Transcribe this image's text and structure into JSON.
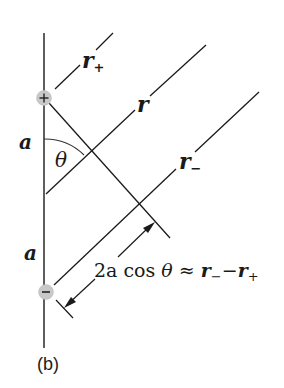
{
  "diagram": {
    "caption": "(b)",
    "labels": {
      "r_plus": "r",
      "r_plus_sub": "+",
      "r": "r",
      "r_minus": "r",
      "r_minus_sub": "−",
      "a_top": "a",
      "a_bottom": "a",
      "theta": "θ",
      "formula_prefix": "2a cos ",
      "formula_theta": "θ",
      "formula_approx": " ≈ ",
      "formula_r1": "r",
      "formula_r1_sub": "−",
      "formula_minus": "−",
      "formula_r2": "r",
      "formula_r2_sub": "+"
    },
    "charges": [
      {
        "sign": "+",
        "label": "positive-charge"
      },
      {
        "sign": "−",
        "label": "negative-charge"
      }
    ],
    "colors": {
      "line": "#1a1a1a",
      "charge_fill": "#c8c8c8",
      "background": "#ffffff"
    }
  }
}
